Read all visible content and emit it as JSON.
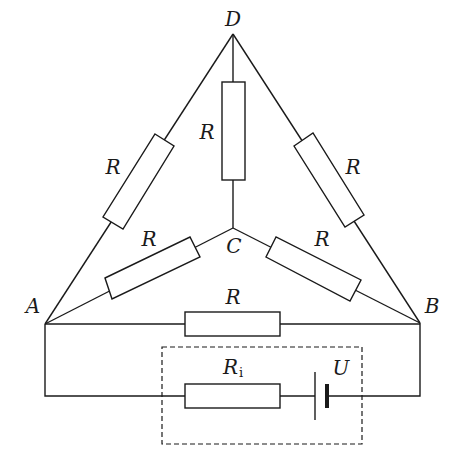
{
  "diagram": {
    "type": "circuit",
    "nodes": {
      "A": {
        "label": "A"
      },
      "B": {
        "label": "B"
      },
      "C": {
        "label": "C"
      },
      "D": {
        "label": "D"
      }
    },
    "resistors": [
      {
        "id": "R_AD",
        "between": [
          "A",
          "D"
        ],
        "label": "R"
      },
      {
        "id": "R_CD",
        "between": [
          "C",
          "D"
        ],
        "label": "R"
      },
      {
        "id": "R_BD",
        "between": [
          "B",
          "D"
        ],
        "label": "R"
      },
      {
        "id": "R_AC",
        "between": [
          "A",
          "C"
        ],
        "label": "R"
      },
      {
        "id": "R_BC",
        "between": [
          "B",
          "C"
        ],
        "label": "R"
      },
      {
        "id": "R_AB",
        "between": [
          "A",
          "B"
        ],
        "label": "R"
      }
    ],
    "source": {
      "internal_resistance": {
        "label_main": "R",
        "label_sub": "i"
      },
      "battery": {
        "label": "U"
      },
      "enclosure": "dashed-box"
    }
  }
}
